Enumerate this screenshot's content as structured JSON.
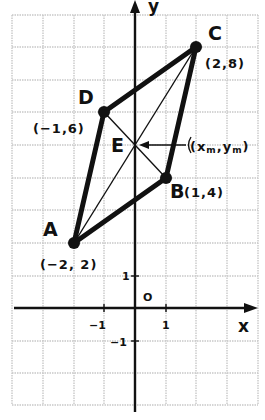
{
  "diagram": {
    "type": "coordinate-plane-parallelogram",
    "grid": {
      "x_range": [
        -4,
        4
      ],
      "y_range": [
        -3,
        9
      ],
      "origin_label": "O"
    },
    "axes": {
      "x_label": "x",
      "y_label": "y",
      "ticks": {
        "x_pos": "1",
        "x_neg": "−1",
        "y_pos": "1",
        "y_neg": "−1"
      }
    },
    "points": [
      {
        "name": "A",
        "x": -2,
        "y": 2,
        "coord_label": "(−2, 2)"
      },
      {
        "name": "B",
        "x": 1,
        "y": 4,
        "coord_label": "(1,4)"
      },
      {
        "name": "C",
        "x": 2,
        "y": 8,
        "coord_label": "(2,8)"
      },
      {
        "name": "D",
        "x": -1,
        "y": 6,
        "coord_label": "(−1,6)"
      }
    ],
    "midpoint": {
      "name": "E",
      "x": 0,
      "y": 5,
      "label": "(x",
      "sub_m": "m",
      "comma": ",y",
      "sub_m2": "m",
      "close": ")"
    },
    "sides": [
      [
        "A",
        "B"
      ],
      [
        "B",
        "C"
      ],
      [
        "C",
        "D"
      ],
      [
        "D",
        "A"
      ]
    ],
    "diagonals": [
      [
        "A",
        "C"
      ],
      [
        "B",
        "D"
      ]
    ],
    "colors": {
      "ink": "#111111",
      "grid": "#c8c8c8",
      "background": "#ffffff"
    }
  }
}
